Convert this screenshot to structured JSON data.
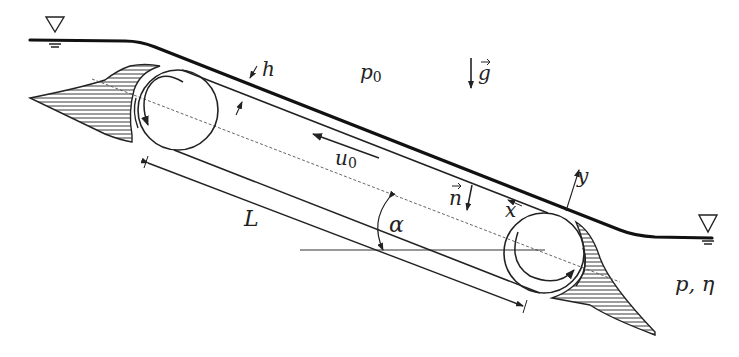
{
  "diagram": {
    "type": "physics schematic",
    "labels": {
      "film_thickness": "h",
      "ambient_pressure_base": "p",
      "ambient_pressure_sub": "0",
      "gravity_vec": "g",
      "belt_velocity_base": "u",
      "belt_velocity_sub": "0",
      "normal_vec": "n",
      "x_axis": "x",
      "y_axis": "y",
      "belt_length": "L",
      "incline_angle": "α",
      "liquid_props": "p, η"
    },
    "elements": [
      {
        "name": "free-surface",
        "style": "thick line"
      },
      {
        "name": "left-water-level-marker",
        "symbol": "▽"
      },
      {
        "name": "right-water-level-marker",
        "symbol": "▽"
      },
      {
        "name": "left-roller",
        "rotation": "counter-clockwise arrow"
      },
      {
        "name": "right-roller",
        "rotation": "clockwise arrow"
      },
      {
        "name": "left-hatched-meniscus"
      },
      {
        "name": "right-hatched-meniscus"
      },
      {
        "name": "belt",
        "direction": "upward along incline (u0 arrow)"
      },
      {
        "name": "centerline",
        "style": "dashed"
      },
      {
        "name": "horizontal-reference",
        "style": "thin line"
      }
    ],
    "colors": {
      "ink": "#222222",
      "background": "#ffffff"
    }
  }
}
